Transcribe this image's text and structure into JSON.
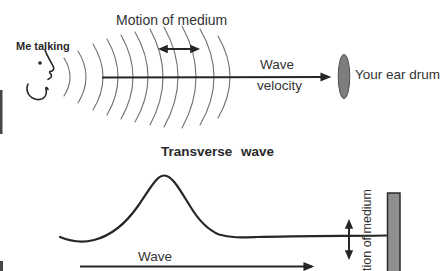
{
  "colors": {
    "background": "#ffffff",
    "ink": "#262626",
    "text": "#333333",
    "text-bold": "#2a2a2a",
    "arc": "#6f6f6f",
    "eardrum-fill": "#7d7d7d",
    "eardrum-stroke": "#505050",
    "wall-fill": "#8f8f8f",
    "wall-stroke": "#2b2b2b"
  },
  "longitudinal_panel": {
    "speaker_label": "Me talking",
    "medium_motion_label": "Motion of medium",
    "velocity_label_line1": "Wave",
    "velocity_label_line2": "velocity",
    "eardrum_label": "Your ear drum"
  },
  "transverse_panel": {
    "title": "Transverse wave",
    "velocity_label": "Wave",
    "medium_motion_label": "tion of medium"
  }
}
